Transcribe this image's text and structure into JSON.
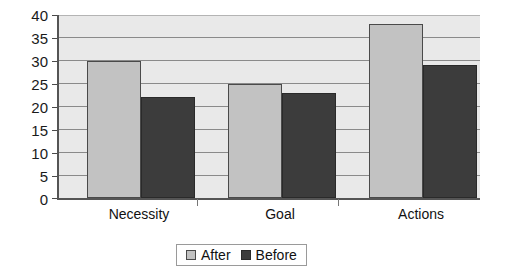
{
  "chart_data": {
    "type": "bar",
    "title": "",
    "subtitle": "",
    "xlabel": "",
    "ylabel": "",
    "categories": [
      "Necessity",
      "Goal",
      "Actions"
    ],
    "series": [
      {
        "name": "After",
        "values": [
          30,
          25,
          38
        ],
        "color": "#c2c2c2"
      },
      {
        "name": "Before",
        "values": [
          22,
          23,
          29
        ],
        "color": "#3c3c3c"
      }
    ],
    "ylim": [
      0,
      40
    ],
    "ytick_step": 5,
    "yticks": [
      0,
      5,
      10,
      15,
      20,
      25,
      30,
      35,
      40
    ],
    "ytick_labels": [
      "0",
      "5",
      "10",
      "15",
      "20",
      "25",
      "30",
      "35",
      "40"
    ],
    "grid": true,
    "grid_axis": "y",
    "legend_position": "bottom-center",
    "plot_background": "#e9e9e9",
    "gridline_color": "#8a8a8a",
    "axis_color": "#555555"
  },
  "legend": {
    "entries": [
      {
        "label": "After"
      },
      {
        "label": "Before"
      }
    ]
  }
}
